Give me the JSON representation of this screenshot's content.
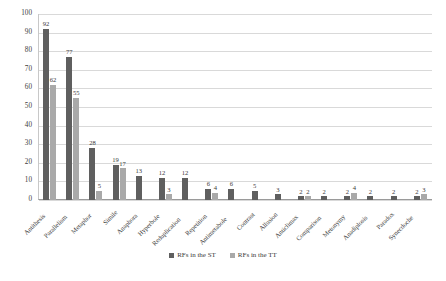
{
  "chart_data": {
    "type": "bar",
    "title": "",
    "subtitle": "",
    "xlabel": "",
    "ylabel": "",
    "ylim": [
      0,
      100
    ],
    "yticks": [
      0,
      10,
      20,
      30,
      40,
      50,
      60,
      70,
      80,
      90,
      100
    ],
    "grid": true,
    "legend_position": "bottom",
    "categories": [
      "Antithesis",
      "Parallelism",
      "Metaphor",
      "Simile",
      "Anaphora",
      "Hyperbole",
      "Reduplication",
      "Repetition",
      "Antimetabole",
      "Contrast",
      "Allusion",
      "Anticlimax",
      "Comparison",
      "Metonymy",
      "Anadiplosis",
      "Paradox",
      "Synecdoche"
    ],
    "series": [
      {
        "name": "RFs in the ST",
        "color": "#5f5f5f",
        "values": [
          92,
          77,
          28,
          19,
          13,
          12,
          12,
          6,
          6,
          5,
          3,
          2,
          2,
          2,
          2,
          2,
          2
        ]
      },
      {
        "name": "RFs in the TT",
        "color": "#a9a9a9",
        "values": [
          62,
          55,
          5,
          17,
          0,
          3,
          0,
          4,
          0,
          0,
          0,
          2,
          0,
          4,
          0,
          0,
          3
        ]
      }
    ]
  },
  "legend": {
    "items": [
      {
        "label": "RFs in the ST"
      },
      {
        "label": "RFs in the TT"
      }
    ]
  },
  "colors": {
    "series_st": "#5f5f5f",
    "series_tt": "#a9a9a9",
    "gridline": "#d9d9d9",
    "axis": "#9a9a9a",
    "text": "#3b3b3b"
  }
}
